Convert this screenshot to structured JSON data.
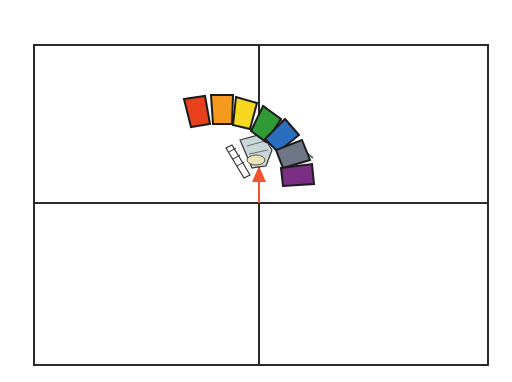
{
  "canvas": {
    "width": 512,
    "height": 382,
    "background": "#ffffff"
  },
  "grid": {
    "frame_color": "#2a2a2a",
    "quadrants": [
      "top-left",
      "top-right",
      "bottom-left",
      "bottom-right"
    ]
  },
  "palette_arc": {
    "swatches": [
      {
        "name": "red",
        "color": "#e8401c"
      },
      {
        "name": "orange",
        "color": "#f59a1e"
      },
      {
        "name": "yellow",
        "color": "#f7d820"
      },
      {
        "name": "green",
        "color": "#2f9a36"
      },
      {
        "name": "blue",
        "color": "#2a6ec0"
      },
      {
        "name": "gray",
        "color": "#6f7687"
      },
      {
        "name": "purple",
        "color": "#7a2f84"
      }
    ],
    "outline_color": "#1c1c1c"
  },
  "pointer": {
    "color": "#f2522e",
    "direction": "up"
  },
  "tool": {
    "name": "brush-tool",
    "color": "#c9d6d8"
  }
}
